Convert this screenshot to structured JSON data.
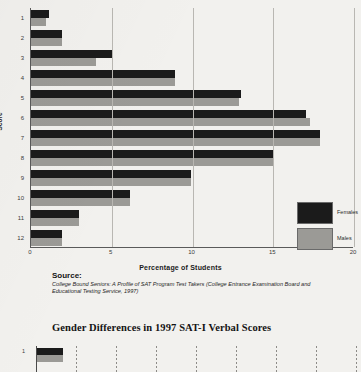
{
  "chart_data": {
    "type": "bar",
    "orientation": "horizontal",
    "title": "",
    "xlabel": "Percentage of Students",
    "ylabel": "Score",
    "categories": [
      "1",
      "2",
      "3",
      "4",
      "5",
      "6",
      "7",
      "8",
      "9",
      "10",
      "11",
      "12"
    ],
    "xticks": [
      0,
      5,
      10,
      15,
      20
    ],
    "xlim": [
      0,
      20
    ],
    "grid": true,
    "legend_position": "bottom-right",
    "series": [
      {
        "name": "Females",
        "color": "#1b1b1b",
        "values": [
          1.1,
          1.9,
          5.0,
          8.9,
          13.0,
          17.0,
          17.9,
          15.0,
          9.9,
          6.1,
          3.0,
          1.9
        ]
      },
      {
        "name": "Males",
        "color": "#9b9a96",
        "values": [
          0.9,
          1.9,
          4.0,
          8.9,
          12.9,
          17.3,
          17.9,
          15.0,
          9.9,
          6.1,
          3.0,
          1.9
        ]
      }
    ]
  },
  "axis": {
    "y_title": "Score",
    "x_title": "Percentage of Students",
    "y_tick_labels": [
      "1",
      "2",
      "3",
      "4",
      "5",
      "6",
      "7",
      "8",
      "9",
      "10",
      "11",
      "12"
    ],
    "x_tick_labels": [
      "0",
      "5",
      "10",
      "15",
      "20"
    ]
  },
  "legend": {
    "items": [
      {
        "label": "Females",
        "color": "#1b1b1b"
      },
      {
        "label": "Males",
        "color": "#9b9a96"
      }
    ]
  },
  "source": {
    "heading": "Source:",
    "text": "College Bound Seniors: A Profile of SAT Program Test Takers (College Entrance Examination Board and Educational Testing Service, 1997)"
  },
  "figure2": {
    "title": "Gender Differences in 1997 SAT-I Verbal Scores",
    "first_category_label": "1"
  }
}
